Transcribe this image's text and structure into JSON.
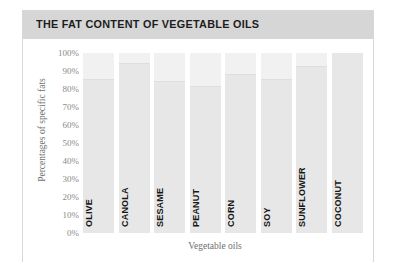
{
  "card": {
    "title": "THE FAT CONTENT OF VEGETABLE OILS"
  },
  "axes": {
    "ylabel": "Percentages of specific fats",
    "xlabel": "Vegetable oils",
    "yticks": [
      "100%",
      "90%",
      "80%",
      "70%",
      "60%",
      "50%",
      "40%",
      "30%",
      "20%",
      "10%",
      "0%"
    ]
  },
  "colors": {
    "header_band": "#d6d6d6",
    "card_border": "#d8d8d8",
    "bar_track": "#f1f1f1",
    "bar_fill": "#e7e7e7",
    "title_text": "#1d1d1d",
    "tick_text": "#8a8a8a",
    "category_text": "#161616",
    "page_background": "#ffffff"
  },
  "chart_data": {
    "type": "bar",
    "title": "THE FAT CONTENT OF VEGETABLE OILS",
    "xlabel": "Vegetable oils",
    "ylabel": "Percentages of specific fats",
    "ylim": [
      0,
      100
    ],
    "yticks": [
      0,
      10,
      20,
      30,
      40,
      50,
      60,
      70,
      80,
      90,
      100
    ],
    "grid": false,
    "legend": "none",
    "categories": [
      "OLIVE",
      "CANOLA",
      "SESAME",
      "PEANUT",
      "CORN",
      "SOY",
      "SUNFLOWER",
      "COCONUT"
    ],
    "values": [
      85,
      94,
      84,
      81,
      88,
      85,
      92,
      100
    ],
    "bars": [
      {
        "label": "OLIVE",
        "value": 85
      },
      {
        "label": "CANOLA",
        "value": 94
      },
      {
        "label": "SESAME",
        "value": 84
      },
      {
        "label": "PEANUT",
        "value": 81
      },
      {
        "label": "CORN",
        "value": 88
      },
      {
        "label": "SOY",
        "value": 85
      },
      {
        "label": "SUNFLOWER",
        "value": 92
      },
      {
        "label": "COCONUT",
        "value": 100
      }
    ]
  }
}
